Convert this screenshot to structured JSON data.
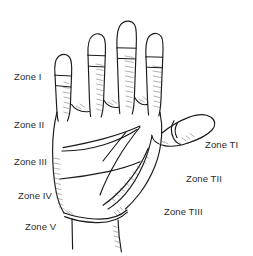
{
  "figure": {
    "background_color": "#ffffff",
    "line_color": "#1a1a1a",
    "text_color": "#2b2b2b"
  },
  "labels": {
    "zone_1": "Zone I",
    "zone_2": "Zone II",
    "zone_3": "Zone III",
    "zone_4": "Zone IV",
    "zone_5": "Zone V",
    "zone_t1": "Zone TI",
    "zone_t2": "Zone TII",
    "zone_t3": "Zone TIII"
  },
  "zones": [
    {
      "id": "I",
      "label": "Zone I",
      "side": "left",
      "x": 14,
      "y": 71
    },
    {
      "id": "II",
      "label": "Zone II",
      "side": "left",
      "x": 14,
      "y": 119
    },
    {
      "id": "III",
      "label": "Zone III",
      "side": "left",
      "x": 14,
      "y": 156
    },
    {
      "id": "IV",
      "label": "Zone IV",
      "side": "left",
      "x": 18,
      "y": 190
    },
    {
      "id": "V",
      "label": "Zone V",
      "side": "left",
      "x": 25,
      "y": 221
    },
    {
      "id": "TI",
      "label": "Zone TI",
      "side": "right",
      "x": 205,
      "y": 139
    },
    {
      "id": "TII",
      "label": "Zone TII",
      "side": "right",
      "x": 186,
      "y": 173
    },
    {
      "id": "TIII",
      "label": "Zone TIII",
      "side": "right",
      "x": 164,
      "y": 206
    }
  ]
}
